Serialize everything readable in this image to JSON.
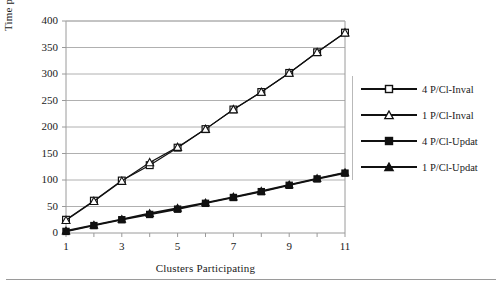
{
  "chart_data": {
    "type": "line",
    "title": "",
    "xlabel": "Clusters Participating",
    "ylabel": "Time per Barrier (μsec)",
    "xlim": [
      1,
      11
    ],
    "ylim": [
      0,
      400
    ],
    "ytick_step": 50,
    "xtick_step": 1,
    "xtick_labels_shown": [
      "1",
      "3",
      "5",
      "7",
      "9",
      "11"
    ],
    "ytick_labels": [
      "0",
      "50",
      "100",
      "150",
      "200",
      "250",
      "300",
      "350",
      "400"
    ],
    "grid": "horizontal",
    "legend_position": "right",
    "x": [
      1,
      2,
      3,
      4,
      5,
      6,
      7,
      8,
      9,
      10,
      11
    ],
    "series": [
      {
        "name": "4 P/Cl-Inval",
        "marker": "open-square",
        "values": [
          25,
          61,
          99,
          128,
          161,
          196,
          233,
          266,
          302,
          341,
          378
        ]
      },
      {
        "name": "1 P/Cl-Inval",
        "marker": "open-triangle",
        "values": [
          24,
          60,
          98,
          133,
          162,
          196,
          233,
          266,
          302,
          341,
          378
        ]
      },
      {
        "name": "4 P/Cl-Updat",
        "marker": "filled-square",
        "values": [
          3,
          14,
          25,
          35,
          45,
          56,
          67,
          78,
          90,
          102,
          113
        ]
      },
      {
        "name": "1 P/Cl-Updat",
        "marker": "filled-triangle",
        "values": [
          4,
          15,
          26,
          37,
          47,
          57,
          68,
          79,
          91,
          103,
          114
        ]
      }
    ],
    "colors": {
      "line": "#111111",
      "grid": "#b0b0b0",
      "axis": "#9a9a9a",
      "marker_fill_open": "#ffffff",
      "marker_fill_solid": "#111111"
    }
  },
  "legend": {
    "items": [
      {
        "label": "4 P/Cl-Inval"
      },
      {
        "label": "1 P/Cl-Inval"
      },
      {
        "label": "4 P/Cl-Updat"
      },
      {
        "label": "1 P/Cl-Updat"
      }
    ]
  }
}
